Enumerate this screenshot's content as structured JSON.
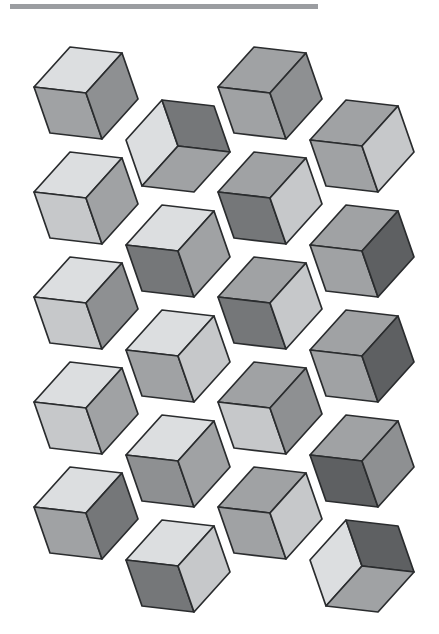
{
  "canvas": {
    "width": 439,
    "height": 634,
    "background": "#ffffff"
  },
  "top_rule": {
    "x": 10,
    "y": 4,
    "width": 308,
    "height": 5,
    "color": "#9b9da1"
  },
  "chart_data": {
    "type": "pattern",
    "title": "",
    "palette": {
      "L": "#dcdee0",
      "ML": "#c6c8ca",
      "M": "#a0a2a4",
      "MD": "#8e9092",
      "D1": "#757779",
      "D2": "#5e6062"
    },
    "stroke": {
      "color": "#2a2c2e",
      "width": 1.7
    },
    "geometry": {
      "spoke_left": [
        -52,
        -6
      ],
      "spoke_upper_right": [
        36,
        -40
      ],
      "spoke_bottom": [
        16,
        46
      ],
      "col_x": [
        86,
        178,
        270,
        362
      ],
      "row_y_start": 93,
      "row_step": 105,
      "odd_col_offset_y": 53
    },
    "cubes": [
      {
        "col": 0,
        "row": 0,
        "view": "above",
        "faces": [
          "L",
          "M",
          "MD"
        ]
      },
      {
        "col": 0,
        "row": 1,
        "view": "above",
        "faces": [
          "L",
          "ML",
          "M"
        ]
      },
      {
        "col": 0,
        "row": 2,
        "view": "above",
        "faces": [
          "L",
          "ML",
          "MD"
        ]
      },
      {
        "col": 0,
        "row": 3,
        "view": "above",
        "faces": [
          "L",
          "ML",
          "M"
        ]
      },
      {
        "col": 0,
        "row": 4,
        "view": "above",
        "faces": [
          "L",
          "M",
          "D1"
        ]
      },
      {
        "col": 1,
        "row": 0,
        "view": "below",
        "faces": [
          "L",
          "D1",
          "M"
        ]
      },
      {
        "col": 1,
        "row": 1,
        "view": "above",
        "faces": [
          "L",
          "D1",
          "M"
        ]
      },
      {
        "col": 1,
        "row": 2,
        "view": "above",
        "faces": [
          "L",
          "M",
          "ML"
        ]
      },
      {
        "col": 1,
        "row": 3,
        "view": "above",
        "faces": [
          "L",
          "MD",
          "M"
        ]
      },
      {
        "col": 1,
        "row": 4,
        "view": "above",
        "faces": [
          "L",
          "D1",
          "ML"
        ]
      },
      {
        "col": 2,
        "row": 0,
        "view": "above",
        "faces": [
          "M",
          "M",
          "MD"
        ]
      },
      {
        "col": 2,
        "row": 1,
        "view": "above",
        "faces": [
          "M",
          "D1",
          "ML"
        ]
      },
      {
        "col": 2,
        "row": 2,
        "view": "above",
        "faces": [
          "M",
          "D1",
          "ML"
        ]
      },
      {
        "col": 2,
        "row": 3,
        "view": "above",
        "faces": [
          "M",
          "ML",
          "MD"
        ]
      },
      {
        "col": 2,
        "row": 4,
        "view": "above",
        "faces": [
          "M",
          "M",
          "ML"
        ]
      },
      {
        "col": 3,
        "row": 0,
        "view": "above",
        "faces": [
          "M",
          "M",
          "ML"
        ]
      },
      {
        "col": 3,
        "row": 1,
        "view": "above",
        "faces": [
          "M",
          "M",
          "D2"
        ]
      },
      {
        "col": 3,
        "row": 2,
        "view": "above",
        "faces": [
          "M",
          "M",
          "D2"
        ]
      },
      {
        "col": 3,
        "row": 3,
        "view": "above",
        "faces": [
          "M",
          "D2",
          "MD"
        ]
      },
      {
        "col": 3,
        "row": 4,
        "view": "below",
        "faces": [
          "L",
          "D2",
          "M"
        ]
      }
    ],
    "face_order_above": [
      "top",
      "lower_left",
      "lower_right"
    ],
    "face_order_below": [
      "upper_left",
      "upper_right",
      "bottom"
    ]
  }
}
